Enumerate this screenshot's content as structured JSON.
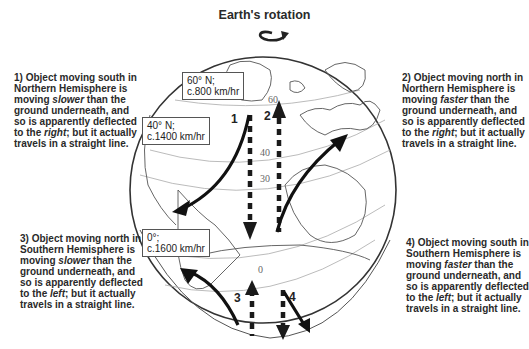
{
  "title": "Earth's rotation",
  "captions": [
    {
      "id": 1,
      "prefix": "1) Object moving south in Northern Hemisphere  is moving ",
      "speed_word": "slower",
      "middle": " than the ground underneath, and so is apparently deflected to the ",
      "direction_word": "right",
      "suffix": "; but it actually travels in a straight line."
    },
    {
      "id": 2,
      "prefix": "2) Object moving north in Northern Hemisphere  is moving ",
      "speed_word": "faster",
      "middle": " than the ground underneath, and so is apparently deflected to the ",
      "direction_word": "right",
      "suffix": "; but it actually travels in a straight line."
    },
    {
      "id": 3,
      "prefix": "3) Object moving north in Southern Hemisphere  is moving ",
      "speed_word": "slower",
      "middle": " than the ground underneath, and so is apparently deflected to the ",
      "direction_word": "left",
      "suffix": "; but it actually travels in a straight line."
    },
    {
      "id": 4,
      "prefix": "4) Object moving south in Southern Hemisphere  is moving ",
      "speed_word": "faster",
      "middle": " than the ground underneath, and so is apparently deflected to the ",
      "direction_word": "left",
      "suffix": "; but it actually travels in a straight line."
    }
  ],
  "latitude_boxes": [
    {
      "lat": "60° N;",
      "speed": "c.800 km/hr"
    },
    {
      "lat": "40° N;",
      "speed": "c.1400 km/hr"
    },
    {
      "lat": "0°;",
      "speed": "c.1600 km/hr"
    }
  ],
  "latitude_lines": [
    "60",
    "40",
    "30",
    "0"
  ],
  "arrow_labels": [
    "1",
    "2",
    "3",
    "4"
  ]
}
